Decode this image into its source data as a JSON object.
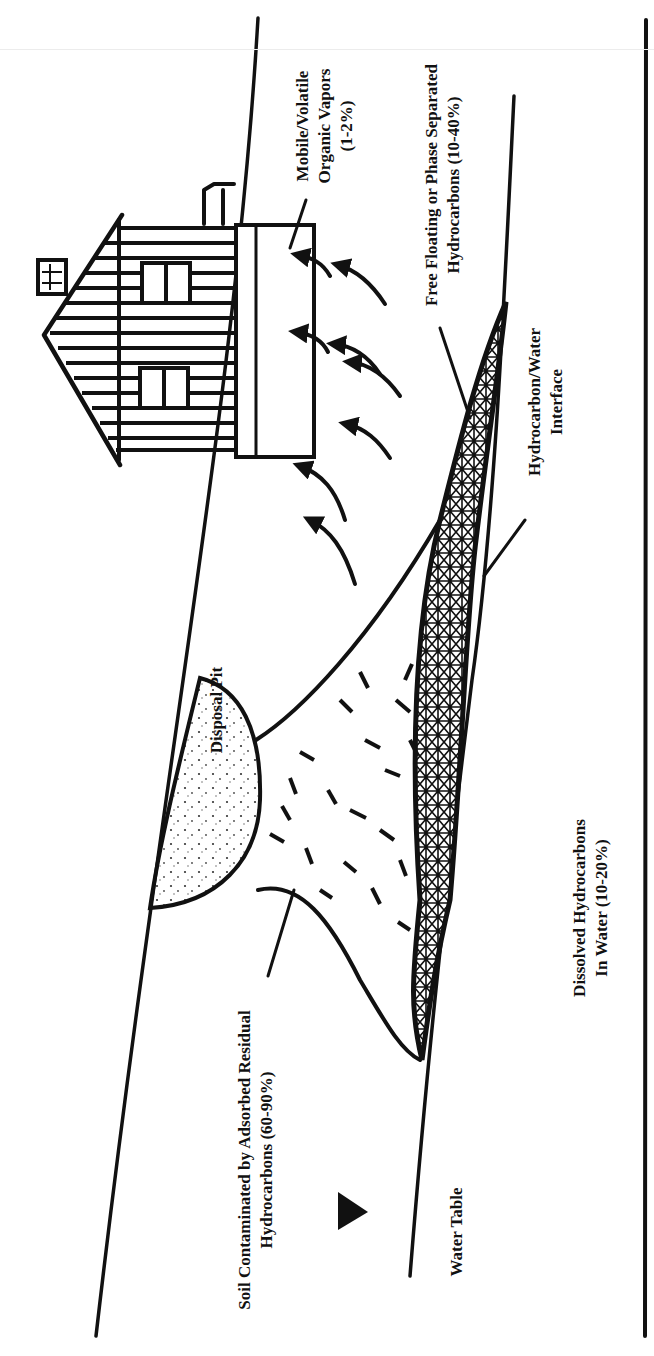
{
  "figure": {
    "orientation": "rotated-90-ccw",
    "colors": {
      "ink": "#111111",
      "background": "#ffffff"
    },
    "labels": {
      "vapors": {
        "lines": [
          "Mobile/Volatile",
          "Organic Vapors",
          "(1-2%)"
        ]
      },
      "free_floating": {
        "lines": [
          "Free Floating or Phase Separated",
          "Hydrocarbons (10-40%)"
        ]
      },
      "interface": {
        "lines": [
          "Hydrocarbon/Water",
          "Interface"
        ]
      },
      "disposal_pit": {
        "text": "Disposal Pit"
      },
      "dissolved": {
        "lines": [
          "Dissolved Hydrocarbons",
          "In Water (10-20%)"
        ]
      },
      "soil": {
        "lines": [
          "Soil Contaminated by Adsorbed Residual",
          "Hydrocarbons (60-90%)"
        ]
      },
      "water_table": {
        "text": "Water Table"
      }
    },
    "symbols": {
      "water_table_marker": "solid-triangle",
      "vapor_arrows": 8
    }
  }
}
